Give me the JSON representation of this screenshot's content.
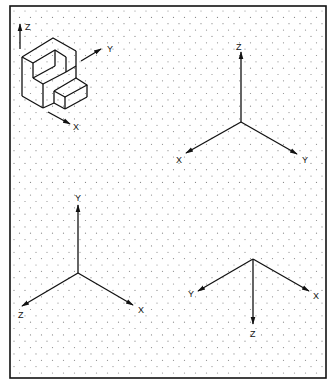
{
  "figure": {
    "type": "isometric-drawing-sheet",
    "background": "#ffffff",
    "line_color": "#111111",
    "dot_color": "#8a8a8a",
    "frame": {
      "x": 10,
      "y": 6,
      "width": 316,
      "height": 372
    },
    "grid": {
      "type": "isometric-dots",
      "col_spacing": 11,
      "row_spacing": 6.35
    }
  },
  "object_view": {
    "label": "Isometric object with coordinate axes",
    "axes": {
      "z_label": "Z",
      "y_label": "Y",
      "x_label": "X"
    }
  },
  "axis_sets": [
    {
      "id": "top-right",
      "origin": [
        241,
        122
      ],
      "axes": [
        {
          "label": "Z",
          "direction": "up",
          "end": [
            241,
            52
          ],
          "label_pos": [
            236,
            50
          ]
        },
        {
          "label": "X",
          "direction": "down-left",
          "end": [
            186,
            153
          ],
          "label_pos": [
            176,
            163
          ]
        },
        {
          "label": "Y",
          "direction": "down-right",
          "end": [
            297,
            154
          ],
          "label_pos": [
            302,
            163
          ]
        }
      ]
    },
    {
      "id": "bottom-left",
      "origin": [
        78,
        273
      ],
      "axes": [
        {
          "label": "Y",
          "direction": "up",
          "end": [
            78,
            205
          ],
          "label_pos": [
            75,
            201
          ]
        },
        {
          "label": "Z",
          "direction": "down-left",
          "end": [
            22,
            306
          ],
          "label_pos": [
            18,
            318
          ]
        },
        {
          "label": "X",
          "direction": "down-right",
          "end": [
            133,
            305
          ],
          "label_pos": [
            138,
            313
          ]
        }
      ]
    },
    {
      "id": "bottom-right",
      "origin": [
        253,
        259
      ],
      "axes": [
        {
          "label": "Z",
          "direction": "down",
          "end": [
            253,
            324
          ],
          "label_pos": [
            250,
            337
          ]
        },
        {
          "label": "Y",
          "direction": "down-left",
          "end": [
            198,
            291
          ],
          "label_pos": [
            188,
            297
          ]
        },
        {
          "label": "X",
          "direction": "down-right",
          "end": [
            309,
            291
          ],
          "label_pos": [
            313,
            299
          ]
        }
      ]
    }
  ]
}
